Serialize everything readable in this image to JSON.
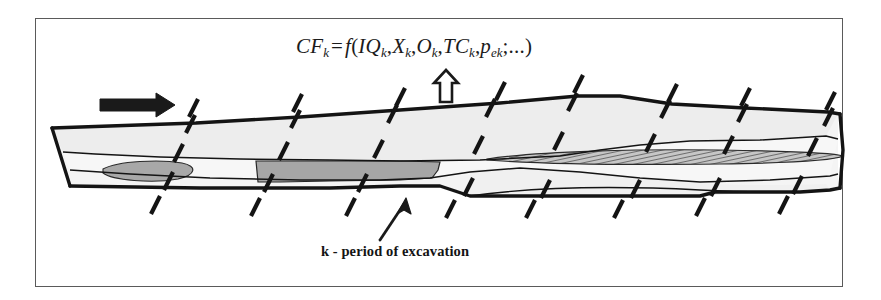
{
  "figure": {
    "kind": "geological-cross-section-diagram",
    "background_color": "#ffffff",
    "frame_color": "#5a5a5a"
  },
  "formula": {
    "lhs": "CF",
    "lhs_sub": "k",
    "equals": "=",
    "fn": "f",
    "open_paren": "(",
    "args": [
      {
        "base": "IQ",
        "sub": "k"
      },
      {
        "base": "X",
        "sub": "k"
      },
      {
        "base": "O",
        "sub": "k"
      },
      {
        "base": "TC",
        "sub": "k"
      },
      {
        "base": "p",
        "sub": "ek"
      }
    ],
    "separator": ",",
    "tail": ";...",
    "close_paren": ")",
    "plain_text": "CF_k = f(IQ_k, X_k, O_k, TC_k, p_ek; ...)"
  },
  "caption": {
    "text": "k - period of excavation"
  },
  "annotations": {
    "flow_arrow": {
      "name": "direction-of-advance-arrow",
      "style": "solid-black-right-arrow",
      "color": "#1a1a1a"
    },
    "callout_arrow_up": {
      "name": "hollow-up-arrow",
      "style": "outline-up-arrow",
      "color": "#1a1a1a"
    },
    "caption_arrow": {
      "name": "caption-pointer-arrow",
      "style": "thin-up-right-arrow",
      "color": "#1a1a1a"
    }
  },
  "section": {
    "outline_color": "#1c1c1c",
    "layers": [
      {
        "name": "overburden",
        "fill": "#ececec"
      },
      {
        "name": "interburden",
        "fill": "#f2f2f2"
      },
      {
        "name": "coal-seam-left",
        "fill": "#a9a9a9"
      },
      {
        "name": "coal-seam-right-hatched",
        "fill": "#b4b4b4"
      },
      {
        "name": "lens-left",
        "fill": "#a0a0a0"
      },
      {
        "name": "base",
        "fill": "#f6f6f6"
      }
    ]
  },
  "period_ticks": {
    "name": "excavation-period-boundary-ticks",
    "color": "#161616",
    "slant_degrees": 20,
    "top_x": [
      193,
      297,
      400,
      500,
      578,
      672,
      745,
      830
    ],
    "top_y": 108,
    "bottom_x": [
      155,
      255,
      350,
      450,
      530,
      618,
      700,
      783
    ],
    "bottom_y": 205,
    "inner_upper_x": [
      190,
      295,
      392,
      490,
      572,
      665,
      742,
      828
    ],
    "inner_upper_y": 133,
    "inner_mid_x": [
      178,
      283,
      378,
      478,
      558,
      650,
      728,
      812
    ],
    "inner_mid_y": 162,
    "inner_lower_x": [
      168,
      268,
      362,
      468,
      545,
      635,
      715,
      797
    ],
    "inner_lower_y": 186,
    "count": 8
  }
}
